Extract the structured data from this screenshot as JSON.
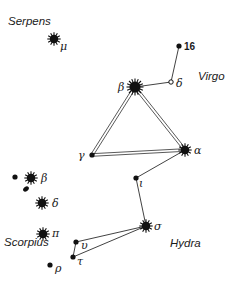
{
  "constellations": [
    {
      "name": "Serpens",
      "x": 8,
      "y": 25
    },
    {
      "name": "Virgo",
      "x": 198,
      "y": 80
    },
    {
      "name": "Scorpius",
      "x": 4,
      "y": 246
    },
    {
      "name": "Hydra",
      "x": 170,
      "y": 247
    }
  ],
  "stars": [
    {
      "id": "mu",
      "label": "μ",
      "x": 54,
      "y": 39,
      "size": "large",
      "lx": 60,
      "ly": 50
    },
    {
      "id": "16",
      "label": "16",
      "x": 179,
      "y": 46,
      "size": "small",
      "lx": 184,
      "ly": 50,
      "numeric": true
    },
    {
      "id": "delta_vir",
      "label": "δ",
      "x": 171,
      "y": 82,
      "size": "open",
      "lx": 176,
      "ly": 87
    },
    {
      "id": "beta_vir",
      "label": "β",
      "x": 135,
      "y": 87,
      "size": "xlarge",
      "lx": 118,
      "ly": 91
    },
    {
      "id": "gamma",
      "label": "γ",
      "x": 92,
      "y": 155,
      "size": "small",
      "lx": 78,
      "ly": 159
    },
    {
      "id": "alpha",
      "label": "α",
      "x": 185,
      "y": 150,
      "size": "large",
      "lx": 194,
      "ly": 154
    },
    {
      "id": "iota",
      "label": "ι",
      "x": 136,
      "y": 178,
      "size": "small",
      "lx": 139,
      "ly": 187
    },
    {
      "id": "sigma",
      "label": "σ",
      "x": 146,
      "y": 226,
      "size": "large",
      "lx": 154,
      "ly": 230
    },
    {
      "id": "upsilon",
      "label": "υ",
      "x": 76,
      "y": 242,
      "size": "small",
      "lx": 81,
      "ly": 249
    },
    {
      "id": "tau",
      "label": "τ",
      "x": 73,
      "y": 257,
      "size": "small",
      "lx": 77,
      "ly": 265
    },
    {
      "id": "beta_sco",
      "label": "β",
      "x": 31,
      "y": 178,
      "size": "large",
      "lx": 41,
      "ly": 182
    },
    {
      "id": "b_dot",
      "label": "",
      "x": 15,
      "y": 177,
      "size": "small"
    },
    {
      "id": "delta_sco",
      "label": "δ",
      "x": 42,
      "y": 203,
      "size": "large",
      "lx": 52,
      "ly": 207
    },
    {
      "id": "pi",
      "label": "π",
      "x": 43,
      "y": 234,
      "size": "large",
      "lx": 52,
      "ly": 237
    },
    {
      "id": "rho",
      "label": "ρ",
      "x": 50,
      "y": 265,
      "size": "small",
      "lx": 55,
      "ly": 272
    }
  ],
  "lines": [
    {
      "from": "16",
      "to": "delta_vir",
      "style": "single"
    },
    {
      "from": "delta_vir",
      "to": "beta_vir",
      "style": "single"
    },
    {
      "from": "beta_vir",
      "to": "gamma",
      "style": "double"
    },
    {
      "from": "beta_vir",
      "to": "alpha",
      "style": "double"
    },
    {
      "from": "gamma",
      "to": "alpha",
      "style": "double"
    },
    {
      "from": "alpha",
      "to": "iota",
      "style": "single"
    },
    {
      "from": "iota",
      "to": "sigma",
      "style": "single"
    },
    {
      "from": "sigma",
      "to": "upsilon",
      "style": "single"
    },
    {
      "from": "sigma",
      "to": "tau",
      "style": "single"
    },
    {
      "from": "upsilon",
      "to": "tau",
      "style": "single"
    }
  ],
  "colors": {
    "ink": "#111111",
    "background": "#ffffff"
  }
}
